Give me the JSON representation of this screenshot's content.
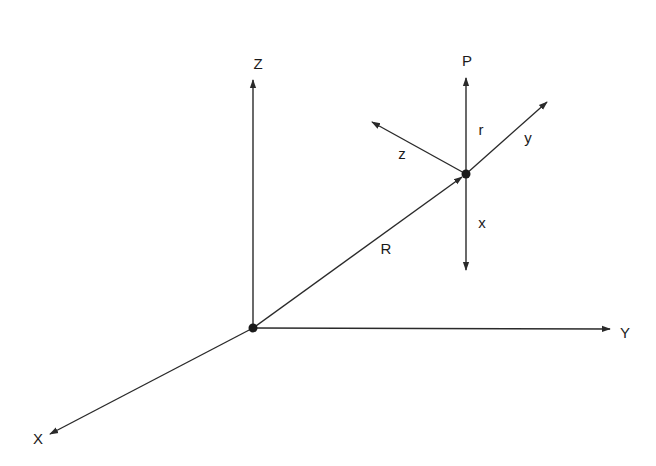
{
  "diagram": {
    "type": "coordinate-frames",
    "global_frame": {
      "origin": [
        253,
        328
      ],
      "axes": [
        {
          "label": "Z",
          "tip": [
            253,
            80
          ],
          "label_pos": [
            258,
            63
          ]
        },
        {
          "label": "Y",
          "tip": [
            610,
            329
          ],
          "label_pos": [
            625,
            332
          ]
        },
        {
          "label": "X",
          "tip": [
            50,
            434
          ],
          "label_pos": [
            38,
            438
          ]
        }
      ]
    },
    "position_vector": {
      "label": "R",
      "from": [
        253,
        328
      ],
      "to": [
        466,
        174
      ],
      "label_pos": [
        386,
        248
      ]
    },
    "local_frame": {
      "origin": [
        466,
        174
      ],
      "axes": [
        {
          "label": "P",
          "tip": [
            466,
            78
          ],
          "label_pos": [
            467,
            60
          ],
          "name": "p-axis"
        },
        {
          "label": "r",
          "tip": null,
          "label_pos": [
            481,
            129
          ],
          "name": "r-annotation"
        },
        {
          "label": "y",
          "tip": [
            547,
            102
          ],
          "label_pos": [
            528,
            137
          ],
          "name": "y-axis"
        },
        {
          "label": "z",
          "tip": [
            372,
            122
          ],
          "label_pos": [
            402,
            153
          ],
          "name": "z-axis"
        },
        {
          "label": "x",
          "tip": [
            466,
            270
          ],
          "label_pos": [
            482,
            222
          ],
          "name": "x-axis"
        }
      ]
    },
    "colors": {
      "line": "#2a2a2a",
      "text": "#1a1a1a",
      "background": "#ffffff"
    }
  }
}
